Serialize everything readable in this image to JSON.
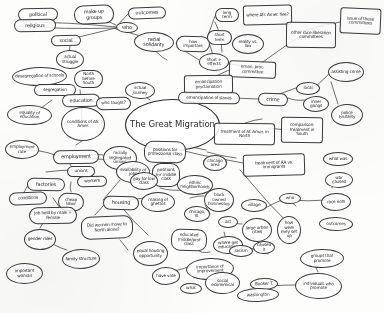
{
  "title": "The Great Migration",
  "doc": {
    "kind": "hand-drawn-mind-map",
    "ink_color": "#2b2b2b",
    "paper_color": "#fdfdfc"
  },
  "center": {
    "label": "The Great Migration"
  },
  "nodes": [
    {
      "id": "political",
      "label": "political",
      "x": 18,
      "y": 8,
      "w": 40,
      "h": 13,
      "shape": "rnd",
      "size": "t6"
    },
    {
      "id": "religious",
      "label": "religious",
      "x": 14,
      "y": 19,
      "w": 42,
      "h": 13,
      "shape": "rnd",
      "size": "t6"
    },
    {
      "id": "make-up-groups",
      "label": "make up groups",
      "x": 74,
      "y": 5,
      "w": 40,
      "h": 19,
      "shape": "rnd",
      "size": "t6"
    },
    {
      "id": "who",
      "label": "who",
      "x": 116,
      "y": 22,
      "w": 22,
      "h": 11,
      "shape": "ell",
      "size": "t6"
    },
    {
      "id": "outcomes",
      "label": "outcomes",
      "x": 128,
      "y": 7,
      "w": 38,
      "h": 12,
      "shape": "rnd",
      "size": "t6"
    },
    {
      "id": "social",
      "label": "social",
      "x": 51,
      "y": 35,
      "w": 30,
      "h": 11,
      "shape": "rnd",
      "size": "t6"
    },
    {
      "id": "racial-solidarity",
      "label": "racial solidarity",
      "x": 134,
      "y": 32,
      "w": 40,
      "h": 20,
      "shape": "ell",
      "size": "t6"
    },
    {
      "id": "how-important",
      "label": "how important",
      "x": 176,
      "y": 36,
      "w": 34,
      "h": 16,
      "shape": "rnd",
      "size": "t5"
    },
    {
      "id": "short-term",
      "label": "short term",
      "x": 207,
      "y": 30,
      "w": 25,
      "h": 15,
      "shape": "rnd",
      "size": "t5"
    },
    {
      "id": "long-term",
      "label": "long term",
      "x": 215,
      "y": 8,
      "w": 24,
      "h": 14,
      "shape": "rnd",
      "size": "t5"
    },
    {
      "id": "where-flee",
      "label": "where Afr. Amer. flee?",
      "x": 243,
      "y": 5,
      "w": 49,
      "h": 20,
      "shape": "rect",
      "size": "t5"
    },
    {
      "id": "reality-vs-law",
      "label": "reality vs. law",
      "x": 232,
      "y": 34,
      "w": 32,
      "h": 20,
      "shape": "ell",
      "size": "t5"
    },
    {
      "id": "other-race-comm",
      "label": "other race liberation committees",
      "x": 286,
      "y": 22,
      "w": 50,
      "h": 26,
      "shape": "rect",
      "size": "t5"
    },
    {
      "id": "issue-comm",
      "label": "issue of these committees",
      "x": 340,
      "y": 8,
      "w": 41,
      "h": 26,
      "shape": "rect",
      "size": "t5"
    },
    {
      "id": "actual-struggle",
      "label": "actual struggle",
      "x": 56,
      "y": 50,
      "w": 28,
      "h": 19,
      "shape": "ell",
      "size": "t5"
    },
    {
      "id": "short-effects",
      "label": "short + effects",
      "x": 199,
      "y": 53,
      "w": 30,
      "h": 18,
      "shape": "ell",
      "size": "t5"
    },
    {
      "id": "eman-proc-comm",
      "label": "eman. proc. committee",
      "x": 229,
      "y": 61,
      "w": 47,
      "h": 17,
      "shape": "rect",
      "size": "t5"
    },
    {
      "id": "desegregation",
      "label": "desegregation of schools",
      "x": 12,
      "y": 67,
      "w": 55,
      "h": 19,
      "shape": "ell",
      "size": "t5"
    },
    {
      "id": "north-before-south",
      "label": "North before South",
      "x": 74,
      "y": 70,
      "w": 29,
      "h": 18,
      "shape": "rnd",
      "size": "t5"
    },
    {
      "id": "emancipation-proc",
      "label": "emancipation proclamation",
      "x": 184,
      "y": 75,
      "w": 49,
      "h": 19,
      "shape": "rect",
      "size": "t5"
    },
    {
      "id": "assisting-crime",
      "label": "assisting crime",
      "x": 328,
      "y": 62,
      "w": 36,
      "h": 20,
      "shape": "ell",
      "size": "t5"
    },
    {
      "id": "segregation",
      "label": "segregation",
      "x": 34,
      "y": 84,
      "w": 42,
      "h": 12,
      "shape": "rnd",
      "size": "t5"
    },
    {
      "id": "education",
      "label": "education",
      "x": 62,
      "y": 94,
      "w": 38,
      "h": 13,
      "shape": "rnd",
      "size": "t6"
    },
    {
      "id": "who-taught",
      "label": "who taught?",
      "x": 96,
      "y": 97,
      "w": 35,
      "h": 13,
      "shape": "rnd",
      "size": "t5"
    },
    {
      "id": "actual-journey",
      "label": "actual journey",
      "x": 125,
      "y": 82,
      "w": 30,
      "h": 17,
      "shape": "ell",
      "size": "t5"
    },
    {
      "id": "emancipation-slaves",
      "label": "emancipation of slaves",
      "x": 178,
      "y": 92,
      "w": 62,
      "h": 12,
      "shape": "rnd",
      "size": "t5"
    },
    {
      "id": "crime",
      "label": "crime",
      "x": 258,
      "y": 93,
      "w": 30,
      "h": 13,
      "shape": "rnd",
      "size": "t6"
    },
    {
      "id": "local",
      "label": "local",
      "x": 296,
      "y": 82,
      "w": 24,
      "h": 13,
      "shape": "ell",
      "size": "t5"
    },
    {
      "id": "inner-gang",
      "label": "inner gangs",
      "x": 303,
      "y": 96,
      "w": 26,
      "h": 16,
      "shape": "ell",
      "size": "t5"
    },
    {
      "id": "equality-education",
      "label": "equality of education",
      "x": 7,
      "y": 105,
      "w": 45,
      "h": 20,
      "shape": "ell",
      "size": "t5"
    },
    {
      "id": "conditions-afr",
      "label": "conditions of Afr. Amer.",
      "x": 61,
      "y": 107,
      "w": 44,
      "h": 34,
      "shape": "ell",
      "size": "t5"
    },
    {
      "id": "treatment-north",
      "label": "treatment of Af. Amer. in North",
      "x": 214,
      "y": 123,
      "w": 61,
      "h": 22,
      "shape": "rect",
      "size": "t5"
    },
    {
      "id": "comparison-south",
      "label": "comparison: treatment in South",
      "x": 281,
      "y": 117,
      "w": 42,
      "h": 26,
      "shape": "rect",
      "size": "t5"
    },
    {
      "id": "police-brutality",
      "label": "police brutality",
      "x": 331,
      "y": 104,
      "w": 32,
      "h": 22,
      "shape": "ell",
      "size": "t5"
    },
    {
      "id": "employment-rate",
      "label": "employment rate",
      "x": 5,
      "y": 140,
      "w": 34,
      "h": 19,
      "shape": "ell",
      "size": "t5"
    },
    {
      "id": "employment",
      "label": "employment",
      "x": 53,
      "y": 150,
      "w": 46,
      "h": 14,
      "shape": "rnd",
      "size": "t6"
    },
    {
      "id": "racially-seg-unions",
      "label": "racially segregated unions",
      "x": 103,
      "y": 146,
      "w": 34,
      "h": 24,
      "shape": "ell",
      "size": "t5"
    },
    {
      "id": "positions-prof",
      "label": "positions for professional class",
      "x": 144,
      "y": 141,
      "w": 42,
      "h": 22,
      "shape": "rnd",
      "size": "t5"
    },
    {
      "id": "treatment-immig",
      "label": "treatment of AA vs. immigrants",
      "x": 243,
      "y": 154,
      "w": 62,
      "h": 22,
      "shape": "rect",
      "size": "t5"
    },
    {
      "id": "what-was",
      "label": "what was",
      "x": 323,
      "y": 152,
      "w": 30,
      "h": 14,
      "shape": "ell",
      "size": "t5"
    },
    {
      "id": "unions",
      "label": "unions",
      "x": 67,
      "y": 166,
      "w": 28,
      "h": 11,
      "shape": "rnd",
      "size": "t5"
    },
    {
      "id": "availability-jobs",
      "label": "availability of jobs",
      "x": 116,
      "y": 161,
      "w": 34,
      "h": 22,
      "shape": "ell",
      "size": "t5"
    },
    {
      "id": "positions-middle",
      "label": "positions for middle class",
      "x": 152,
      "y": 163,
      "w": 28,
      "h": 24,
      "shape": "rnd",
      "size": "t5"
    },
    {
      "id": "ethnic-neighbor",
      "label": "ethnic neighborhoods",
      "x": 177,
      "y": 175,
      "w": 36,
      "h": 20,
      "shape": "ell",
      "size": "t5"
    },
    {
      "id": "chicago-area",
      "label": "chicago area",
      "x": 203,
      "y": 155,
      "w": 24,
      "h": 16,
      "shape": "ell",
      "size": "t5"
    },
    {
      "id": "factories",
      "label": "factories",
      "x": 27,
      "y": 178,
      "w": 38,
      "h": 13,
      "shape": "rnd",
      "size": "t6"
    },
    {
      "id": "workers",
      "label": "workers",
      "x": 77,
      "y": 176,
      "w": 30,
      "h": 11,
      "shape": "rnd",
      "size": "t5"
    },
    {
      "id": "housing",
      "label": "housing",
      "x": 103,
      "y": 196,
      "w": 36,
      "h": 14,
      "shape": "rnd",
      "size": "t6"
    },
    {
      "id": "pay-for-low",
      "label": "pay for low class",
      "x": 130,
      "y": 172,
      "w": 28,
      "h": 18,
      "shape": "ell",
      "size": "t5"
    },
    {
      "id": "conditions",
      "label": "conditions",
      "x": 9,
      "y": 192,
      "w": 38,
      "h": 13,
      "shape": "rnd",
      "size": "t5"
    },
    {
      "id": "cheap-labor",
      "label": "cheap labor",
      "x": 58,
      "y": 193,
      "w": 26,
      "h": 18,
      "shape": "rnd",
      "size": "t5"
    },
    {
      "id": "making-ghettos",
      "label": "making of ghettos",
      "x": 141,
      "y": 192,
      "w": 34,
      "h": 20,
      "shape": "ell",
      "size": "t5"
    },
    {
      "id": "black-owned",
      "label": "black owned businesses",
      "x": 204,
      "y": 188,
      "w": 30,
      "h": 24,
      "shape": "ell",
      "size": "t5"
    },
    {
      "id": "chicago-lll",
      "label": "chicago, Ill.",
      "x": 184,
      "y": 206,
      "w": 26,
      "h": 16,
      "shape": "ell",
      "size": "t5"
    },
    {
      "id": "villages",
      "label": "village",
      "x": 241,
      "y": 199,
      "w": 26,
      "h": 13,
      "shape": "ell",
      "size": "t5"
    },
    {
      "id": "who",
      "label": "who",
      "x": 279,
      "y": 193,
      "w": 22,
      "h": 11,
      "shape": "ell",
      "size": "t5"
    },
    {
      "id": "race-riots",
      "label": "race riots",
      "x": 321,
      "y": 193,
      "w": 30,
      "h": 18,
      "shape": "ell",
      "size": "t5"
    },
    {
      "id": "war-caused",
      "label": "war caused",
      "x": 325,
      "y": 172,
      "w": 28,
      "h": 16,
      "shape": "ell",
      "size": "t5"
    },
    {
      "id": "job-held",
      "label": "job held by male + female",
      "x": 29,
      "y": 207,
      "w": 48,
      "h": 17,
      "shape": "rnd",
      "size": "t5"
    },
    {
      "id": "did-women-move",
      "label": "Did women move to North alone?",
      "x": 81,
      "y": 216,
      "w": 52,
      "h": 23,
      "shape": "rnd",
      "size": "t5"
    },
    {
      "id": "educated-middle",
      "label": "educated middle/prof class",
      "x": 171,
      "y": 229,
      "w": 36,
      "h": 22,
      "shape": "rnd",
      "size": "t5"
    },
    {
      "id": "large-urban",
      "label": "large urban cities",
      "x": 242,
      "y": 218,
      "w": 30,
      "h": 24,
      "shape": "ell",
      "size": "t5"
    },
    {
      "id": "how-set-up",
      "label": "how were they set up",
      "x": 277,
      "y": 216,
      "w": 24,
      "h": 28,
      "shape": "ell",
      "size": "t5"
    },
    {
      "id": "outcomes2",
      "label": "outcomes",
      "x": 319,
      "y": 217,
      "w": 34,
      "h": 14,
      "shape": "ell",
      "size": "t5"
    },
    {
      "id": "gender-roles",
      "label": "gender roles",
      "x": 24,
      "y": 229,
      "w": 32,
      "h": 21,
      "shape": "ell",
      "size": "t5"
    },
    {
      "id": "act",
      "label": "act",
      "x": 218,
      "y": 216,
      "w": 20,
      "h": 12,
      "shape": "ell",
      "size": "t5"
    },
    {
      "id": "equal-housing",
      "label": "equal housing opportunity",
      "x": 133,
      "y": 241,
      "w": 35,
      "h": 25,
      "shape": "ell",
      "size": "t5"
    },
    {
      "id": "where-get-edu",
      "label": "where get education",
      "x": 213,
      "y": 236,
      "w": 30,
      "h": 18,
      "shape": "ell",
      "size": "t5"
    },
    {
      "id": "racism",
      "label": "racism",
      "x": 229,
      "y": 245,
      "w": 24,
      "h": 12,
      "shape": "ell",
      "size": "t5"
    },
    {
      "id": "caused-it",
      "label": "caused it",
      "x": 253,
      "y": 241,
      "w": 22,
      "h": 13,
      "shape": "ell",
      "size": "t5"
    },
    {
      "id": "family-structure",
      "label": "family structure",
      "x": 62,
      "y": 249,
      "w": 38,
      "h": 20,
      "shape": "ell",
      "size": "t5"
    },
    {
      "id": "groups-promote",
      "label": "groups that promote",
      "x": 300,
      "y": 249,
      "w": 44,
      "h": 19,
      "shape": "ell",
      "size": "t5"
    },
    {
      "id": "important-woman",
      "label": "important woman",
      "x": 6,
      "y": 263,
      "w": 37,
      "h": 21,
      "shape": "ell",
      "size": "t5"
    },
    {
      "id": "have-vote",
      "label": "have vote",
      "x": 152,
      "y": 267,
      "w": 28,
      "h": 18,
      "shape": "ell",
      "size": "t5"
    },
    {
      "id": "importance-improve",
      "label": "importance of improvement",
      "x": 186,
      "y": 258,
      "w": 48,
      "h": 22,
      "shape": "ell",
      "size": "t5"
    },
    {
      "id": "social-economical",
      "label": "social economical",
      "x": 205,
      "y": 272,
      "w": 35,
      "h": 22,
      "shape": "ell",
      "size": "t5"
    },
    {
      "id": "what",
      "label": "what",
      "x": 180,
      "y": 283,
      "w": 22,
      "h": 11,
      "shape": "ell",
      "size": "t5"
    },
    {
      "id": "booker-t",
      "label": "Booker T.",
      "x": 250,
      "y": 278,
      "w": 28,
      "h": 12,
      "shape": "ell",
      "size": "t5"
    },
    {
      "id": "washington",
      "label": "washington",
      "x": 237,
      "y": 288,
      "w": 42,
      "h": 14,
      "shape": "ell",
      "size": "t5"
    },
    {
      "id": "individuals-promote",
      "label": "individuals who promote",
      "x": 295,
      "y": 273,
      "w": 47,
      "h": 26,
      "shape": "ell",
      "size": "t5"
    }
  ],
  "edges": [
    [
      "18,22",
      "116,27"
    ],
    [
      "16,26",
      "116,28"
    ],
    [
      "95,16",
      "116,25"
    ],
    [
      "116,27",
      "128,14"
    ],
    [
      "116,28",
      "66,40"
    ],
    [
      "116,29",
      "152,40"
    ],
    [
      "152,46",
      "167,60"
    ],
    [
      "176,44",
      "199,60"
    ],
    [
      "207,38",
      "215,16"
    ],
    [
      "215,22",
      "222,52"
    ],
    [
      "207,40",
      "213,58"
    ],
    [
      "214,60",
      "244,66"
    ],
    [
      "252,70",
      "300,36"
    ],
    [
      "300,32",
      "340,22"
    ],
    [
      "70,46",
      "68,66"
    ],
    [
      "55,78",
      "55,86"
    ],
    [
      "80,90",
      "81,96"
    ],
    [
      "80,100",
      "113,99"
    ],
    [
      "140,91",
      "150,100"
    ],
    [
      "229,70",
      "209,80"
    ],
    [
      "208,88",
      "208,94"
    ],
    [
      "210,98",
      "258,99"
    ],
    [
      "273,96",
      "296,88"
    ],
    [
      "288,98",
      "306,100"
    ],
    [
      "310,92",
      "331,72"
    ],
    [
      "331,82",
      "338,104"
    ],
    [
      "30,115",
      "52,100"
    ],
    [
      "82,107",
      "83,122"
    ],
    [
      "145,125",
      "186,130"
    ],
    [
      "160,110",
      "182,120"
    ],
    [
      "245,123",
      "262,119"
    ],
    [
      "268,128",
      "300,130"
    ],
    [
      "160,140",
      "206,150"
    ],
    [
      "160,145",
      "243,163"
    ],
    [
      "76,145",
      "82,141"
    ],
    [
      "22,150",
      "55,155"
    ],
    [
      "76,157",
      "103,155"
    ],
    [
      "76,158",
      "120,160"
    ],
    [
      "70,164",
      "72,171"
    ],
    [
      "46,172",
      "70,170"
    ],
    [
      "46,184",
      "62,180"
    ],
    [
      "28,185",
      "22,196"
    ],
    [
      "71,182",
      "71,192"
    ],
    [
      "103,200",
      "120,180"
    ],
    [
      "118,203",
      "144,198"
    ],
    [
      "120,205",
      "148,235"
    ],
    [
      "53,198",
      "60,208"
    ],
    [
      "49,215",
      "40,228"
    ],
    [
      "45,238",
      "67,250"
    ],
    [
      "95,215",
      "104,205"
    ],
    [
      "160,188",
      "186,190"
    ],
    [
      "190,198",
      "204,196"
    ],
    [
      "205,205",
      "210,214"
    ],
    [
      "222,222",
      "242,224"
    ],
    [
      "262,210",
      "282,200"
    ],
    [
      "287,198",
      "296,206"
    ],
    [
      "290,200",
      "328,200"
    ],
    [
      "332,188",
      "334,180"
    ],
    [
      "257,228",
      "270,224"
    ],
    [
      "289,230",
      "295,242"
    ],
    [
      "224,232",
      "232,246"
    ],
    [
      "249,248",
      "268,254"
    ],
    [
      "198,250",
      "210,252"
    ],
    [
      "172,271",
      "190,266"
    ],
    [
      "212,280",
      "230,285"
    ],
    [
      "270,286",
      "296,285"
    ],
    [
      "194,278",
      "198,272"
    ],
    [
      "313,260",
      "318,272"
    ],
    [
      "207,152",
      "236,158"
    ],
    [
      "160,130",
      "180,186"
    ],
    [
      "120,240",
      "128,250"
    ],
    [
      "240,170",
      "300,235"
    ]
  ]
}
